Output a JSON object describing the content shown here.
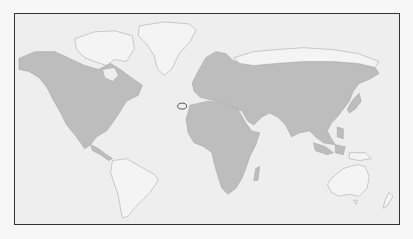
{
  "map": {
    "type": "world distribution map",
    "projection": "equirectangular",
    "colors": {
      "ocean": "#eeeeee",
      "land": "#f4f4f4",
      "range": "#bdbdbd",
      "border": "#333333",
      "marker": "#555555"
    },
    "range_regions": [
      "North America (southern Canada, United States, Mexico, Central America)",
      "Europe",
      "Northern and Central Asia (Russia, Kazakhstan, Mongolia, China)",
      "Middle East and Arabia",
      "South Asia (India)",
      "Southeast Asia (Indochina, Malaysia, Sumatra, Borneo, Java, Philippines)",
      "Japan, Korea, Sakhalin",
      "Africa (entire continent)"
    ],
    "unshaded_regions": [
      "Greenland",
      "Arctic Canadian archipelago",
      "South America",
      "Australia",
      "New Zealand",
      "New Guinea",
      "Arctic Siberian coast"
    ],
    "marker": {
      "shape": "outlined circle",
      "location": "Canary Islands"
    }
  }
}
